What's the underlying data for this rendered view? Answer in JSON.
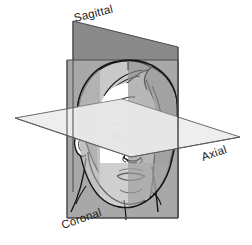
{
  "figure": {
    "width": 252,
    "height": 245,
    "background_color": "#ffffff"
  },
  "labels": {
    "sagittal": "Sagittal",
    "axial": "Axial",
    "coronal": "Coronal"
  },
  "planes": [
    {
      "name": "sagittal",
      "label": "Sagittal",
      "orientation": "vertical-median",
      "fill_color": "#8a8a8a",
      "stroke_color": "#4d4d4d",
      "label_rotation_deg": -14,
      "label_position": {
        "x": 74,
        "y": 18
      }
    },
    {
      "name": "coronal",
      "label": "Coronal",
      "orientation": "vertical-frontal",
      "fill_color": "#a8a8a8",
      "stroke_color": "#4d4d4d",
      "label_rotation_deg": -19,
      "label_position": {
        "x": 62,
        "y": 228
      }
    },
    {
      "name": "axial",
      "label": "Axial",
      "orientation": "horizontal-transverse",
      "fill_color": "#ededed",
      "stroke_color": "#6a6a6a",
      "label_rotation_deg": -19,
      "label_position": {
        "x": 202,
        "y": 160
      }
    }
  ],
  "subject": {
    "name": "head",
    "style": "line-art",
    "line_color": "#1a1a1a",
    "skin_fill": "#ffffff",
    "hair_fill": "#c9c9c9",
    "features": [
      "hair",
      "forehead",
      "eyebrows",
      "eyes",
      "nose",
      "mouth",
      "chin",
      "jaw",
      "ear",
      "neck"
    ]
  }
}
